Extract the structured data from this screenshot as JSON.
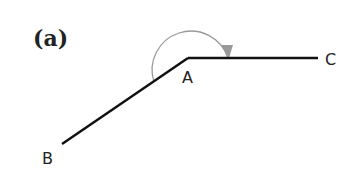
{
  "figure": {
    "panel_label": "(a)",
    "points": {
      "A": {
        "label": "A"
      },
      "B": {
        "label": "B"
      },
      "C": {
        "label": "C"
      }
    },
    "segments": [
      "AB",
      "AC"
    ],
    "angle_arc": {
      "from": "AB",
      "to": "AC",
      "direction": "clockwise",
      "type": "reflex-angle-indicator"
    },
    "colors": {
      "lines": "#111111",
      "arc": "#999999",
      "text": "#222222"
    }
  }
}
